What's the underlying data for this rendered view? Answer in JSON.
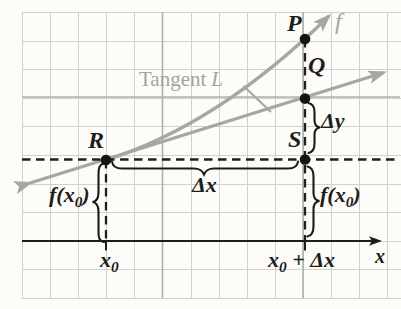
{
  "colors": {
    "background": "#fdfcf8",
    "grid_minor": "#ccd3cc",
    "grid_major": "#a9b3a9",
    "curve_gray": "#a6a6a6",
    "label_gray": "#a3a3a3",
    "ink": "#1d1d1d"
  },
  "points": {
    "p": "P",
    "q": "Q",
    "r": "R",
    "s": "S"
  },
  "curve": {
    "label": "f"
  },
  "tangent": {
    "word": "Tangent",
    "letter": "L"
  },
  "deltas": {
    "dx": "Δx",
    "dy": "Δy"
  },
  "fx0": {
    "pre": "f(x",
    "sub": "0",
    "post": ")"
  },
  "xaxis": {
    "label": "x",
    "x0": {
      "base": "x",
      "sub": "0"
    },
    "x0dx": {
      "base": "x",
      "sub": "0",
      "rest": " + Δx"
    }
  }
}
